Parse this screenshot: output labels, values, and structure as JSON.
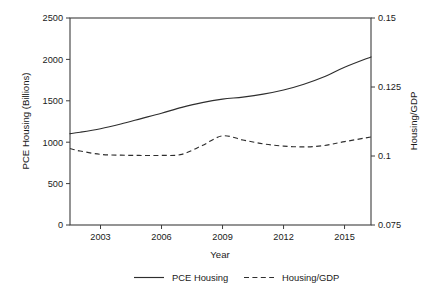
{
  "chart_data": {
    "type": "line",
    "title": "",
    "xlabel": "Year",
    "ylabel": "PCE Housing (Billions)",
    "y2label": "Housing/GDP",
    "grid": false,
    "legend_position": "bottom",
    "xlim": [
      2001.5,
      2016.3
    ],
    "ylim": [
      0,
      2500
    ],
    "y2lim": [
      0.075,
      0.15
    ],
    "xticks": [
      "2003",
      "2006",
      "2009",
      "2012",
      "2015"
    ],
    "xtick_values": [
      2003,
      2006,
      2009,
      2012,
      2015
    ],
    "yticks": [
      "0",
      "500",
      "1000",
      "1500",
      "2000",
      "2500"
    ],
    "ytick_values": [
      0,
      500,
      1000,
      1500,
      2000,
      2500
    ],
    "y2ticks": [
      "0.075",
      "0.1",
      "0.125",
      "0.15"
    ],
    "y2tick_values": [
      0.075,
      0.1,
      0.125,
      0.15
    ],
    "x": [
      2001.5,
      2002,
      2003,
      2004,
      2005,
      2006,
      2007,
      2008,
      2009,
      2010,
      2011,
      2012,
      2013,
      2014,
      2015,
      2016.3
    ],
    "series": [
      {
        "name": "PCE Housing",
        "axis": "left",
        "style": "solid",
        "values": [
          1103,
          1120,
          1163,
          1220,
          1285,
          1350,
          1420,
          1478,
          1520,
          1545,
          1580,
          1630,
          1700,
          1790,
          1905,
          2030
        ]
      },
      {
        "name": "Housing/GDP",
        "axis": "right",
        "style": "dashed",
        "values": [
          0.1027,
          0.1018,
          0.1006,
          0.1003,
          0.1002,
          0.1002,
          0.1006,
          0.1038,
          0.1073,
          0.1058,
          0.1044,
          0.1036,
          0.1033,
          0.1038,
          0.1052,
          0.1069
        ]
      }
    ],
    "legend": [
      {
        "label": "PCE Housing",
        "style": "solid"
      },
      {
        "label": "Housing/GDP",
        "style": "dashed"
      }
    ]
  },
  "plot_box": {
    "left": 70,
    "right": 371,
    "top": 18,
    "bottom": 225
  }
}
